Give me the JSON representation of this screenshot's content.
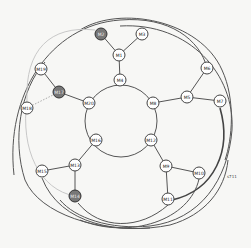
{
  "diagram": {
    "type": "mesh-network-rings",
    "nodes": [
      {
        "id": "M1",
        "label": "M1",
        "x": 119,
        "y": 55,
        "shaded": false
      },
      {
        "id": "M2",
        "label": "M2",
        "x": 101,
        "y": 34,
        "shaded": true
      },
      {
        "id": "M3",
        "label": "M3",
        "x": 142,
        "y": 34,
        "shaded": false
      },
      {
        "id": "M4",
        "label": "M4",
        "x": 120,
        "y": 80,
        "shaded": false
      },
      {
        "id": "M5",
        "label": "M5",
        "x": 187,
        "y": 97,
        "shaded": false
      },
      {
        "id": "M6",
        "label": "M6",
        "x": 207,
        "y": 68,
        "shaded": false
      },
      {
        "id": "M7",
        "label": "M7",
        "x": 220,
        "y": 101,
        "shaded": false
      },
      {
        "id": "M8",
        "label": "M8",
        "x": 153,
        "y": 103,
        "shaded": false
      },
      {
        "id": "M9",
        "label": "M9",
        "x": 166,
        "y": 166,
        "shaded": false
      },
      {
        "id": "M10",
        "label": "M10",
        "x": 199,
        "y": 173,
        "shaded": false
      },
      {
        "id": "M11",
        "label": "M11",
        "x": 168,
        "y": 199,
        "shaded": false
      },
      {
        "id": "M12",
        "label": "M12",
        "x": 151,
        "y": 140,
        "shaded": false
      },
      {
        "id": "M13",
        "label": "M13",
        "x": 75,
        "y": 165,
        "shaded": false
      },
      {
        "id": "M14",
        "label": "M14",
        "x": 75,
        "y": 196,
        "shaded": true
      },
      {
        "id": "M15",
        "label": "M15",
        "x": 42,
        "y": 171,
        "shaded": false
      },
      {
        "id": "M16",
        "label": "M16",
        "x": 96,
        "y": 140,
        "shaded": false
      },
      {
        "id": "M17",
        "label": "M17",
        "x": 59,
        "y": 92,
        "shaded": true
      },
      {
        "id": "M18",
        "label": "M18",
        "x": 27,
        "y": 108,
        "shaded": false
      },
      {
        "id": "M19",
        "label": "M19",
        "x": 41,
        "y": 69,
        "shaded": false
      },
      {
        "id": "M20",
        "label": "M20",
        "x": 89,
        "y": 103,
        "shaded": false
      }
    ],
    "edges": [
      [
        "M2",
        "M1"
      ],
      [
        "M3",
        "M1"
      ],
      [
        "M1",
        "M4"
      ],
      [
        "M6",
        "M5"
      ],
      [
        "M5",
        "M7"
      ],
      [
        "M5",
        "M8"
      ],
      [
        "M12",
        "M9"
      ],
      [
        "M9",
        "M10"
      ],
      [
        "M9",
        "M11"
      ],
      [
        "M16",
        "M13"
      ],
      [
        "M13",
        "M15"
      ],
      [
        "M13",
        "M14"
      ],
      [
        "M19",
        "M17"
      ],
      [
        "M17",
        "M20"
      ]
    ],
    "dotted_edges": [
      [
        "M18",
        "M17"
      ]
    ],
    "annotation": "s711"
  }
}
